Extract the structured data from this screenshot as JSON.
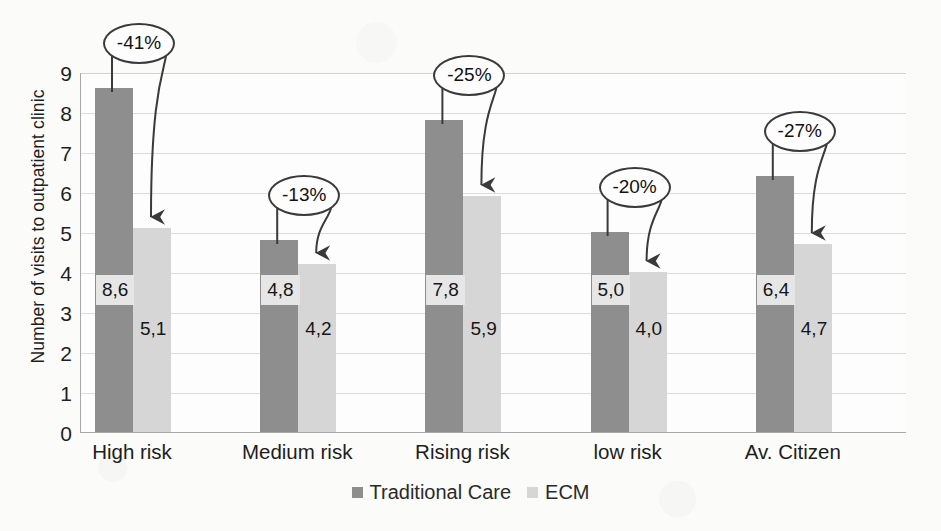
{
  "chart_data": {
    "type": "bar",
    "title": "",
    "xlabel": "",
    "ylabel": "Number of visits to outpatient clinic",
    "ylim": [
      0,
      9
    ],
    "ytick_labels": [
      "0",
      "1",
      "2",
      "3",
      "4",
      "5",
      "6",
      "7",
      "8",
      "9"
    ],
    "grid": true,
    "legend_position": "bottom-center",
    "decimal_separator": ",",
    "categories": [
      "High risk",
      "Medium risk",
      "Rising risk",
      "low risk",
      "Av. Citizen"
    ],
    "series": [
      {
        "name": "Traditional Care",
        "color": "#8e8e8e",
        "values": [
          8.6,
          4.8,
          7.8,
          5.0,
          6.4
        ],
        "value_labels": [
          "8,6",
          "4,8",
          "7,8",
          "5,0",
          "6,4"
        ]
      },
      {
        "name": "ECM",
        "color": "#d6d6d6",
        "values": [
          5.1,
          4.2,
          5.9,
          4.0,
          4.7
        ],
        "value_labels": [
          "5,1",
          "4,2",
          "5,9",
          "4,0",
          "4,7"
        ]
      }
    ],
    "annotations": [
      {
        "category": "High risk",
        "text": "-41%",
        "value": -41
      },
      {
        "category": "Medium risk",
        "text": "-13%",
        "value": -13
      },
      {
        "category": "Rising risk",
        "text": "-25%",
        "value": -25
      },
      {
        "category": "low risk",
        "text": "-20%",
        "value": -20
      },
      {
        "category": "Av. Citizen",
        "text": "-27%",
        "value": -27
      }
    ]
  },
  "legend": {
    "items": [
      {
        "label": "Traditional Care",
        "color": "#8e8e8e"
      },
      {
        "label": "ECM",
        "color": "#d6d6d6"
      }
    ]
  }
}
